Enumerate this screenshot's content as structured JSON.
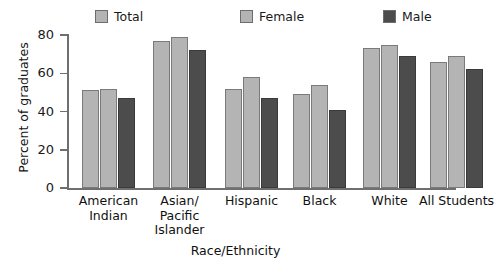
{
  "chart_data": {
    "type": "bar",
    "title": "",
    "xlabel": "Race/Ethnicity",
    "ylabel": "Percent of graduates",
    "categories": [
      "American\nIndian",
      "Asian/\nPacific\nIslander",
      "Hispanic",
      "Black",
      "White",
      "All Students"
    ],
    "series": [
      {
        "name": "Total",
        "values": [
          51,
          77,
          52,
          49,
          73,
          66
        ],
        "color": "#b4b4b4"
      },
      {
        "name": "Female",
        "values": [
          52,
          79,
          58,
          54,
          75,
          69
        ],
        "color": "#b4b4b4"
      },
      {
        "name": "Male",
        "values": [
          47,
          72,
          47,
          41,
          69,
          62
        ],
        "color": "#4c4c4c"
      }
    ],
    "ylim": [
      0,
      80
    ],
    "yticks": [
      0,
      20,
      40,
      60,
      80
    ],
    "ytick_labels": [
      "0",
      "20",
      "40",
      "60",
      "80"
    ],
    "grid": false,
    "legend_position": "top"
  },
  "legend": {
    "items": [
      {
        "label": "Total",
        "swatch_color": "#b4b4b4",
        "icon": "square-swatch-icon"
      },
      {
        "label": "Female",
        "swatch_color": "#b4b4b4",
        "icon": "square-swatch-icon"
      },
      {
        "label": "Male",
        "swatch_color": "#4c4c4c",
        "icon": "square-swatch-icon"
      }
    ]
  },
  "axes": {
    "y_title": "Percent of graduates",
    "x_title": "Race/Ethnicity"
  }
}
